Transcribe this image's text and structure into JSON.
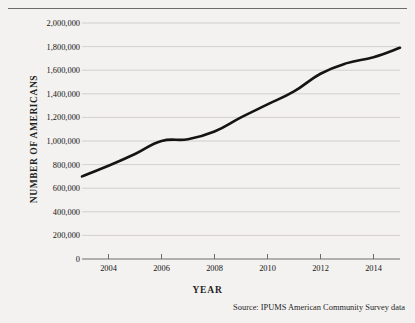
{
  "figure": {
    "background_color": "#f3f2f0",
    "line_color": "#141414",
    "gridline_color": "#c9c7c3",
    "axis_color": "#6e6c68",
    "source_note": "Source:  IPUMS American Community Survey data",
    "cropped_title_remnant": ""
  },
  "chart_data": {
    "type": "line",
    "title": "",
    "xlabel": "YEAR",
    "ylabel": "NUMBER OF AMERICANS",
    "xlim": [
      2003,
      2015
    ],
    "ylim": [
      0,
      2000000
    ],
    "grid": true,
    "legend": "none",
    "x_tick_labels": [
      "2004",
      "2006",
      "2008",
      "2010",
      "2012",
      "2014"
    ],
    "x_ticks": [
      2004,
      2006,
      2008,
      2010,
      2012,
      2014
    ],
    "y_tick_labels": [
      "0",
      "200,000",
      "400,000",
      "600,000",
      "800,000",
      "1,000,000",
      "1,200,000",
      "1,400,000",
      "1,600,000",
      "1,800,000",
      "2,000,000"
    ],
    "y_ticks": [
      0,
      200000,
      400000,
      600000,
      800000,
      1000000,
      1200000,
      1400000,
      1600000,
      1800000,
      2000000
    ],
    "series": [
      {
        "name": "Number of Americans",
        "x": [
          2003,
          2004,
          2005,
          2006,
          2007,
          2008,
          2009,
          2010,
          2011,
          2012,
          2013,
          2014,
          2015
        ],
        "values": [
          700000,
          790000,
          890000,
          1000000,
          1015000,
          1080000,
          1200000,
          1310000,
          1420000,
          1570000,
          1660000,
          1710000,
          1790000
        ]
      }
    ]
  }
}
